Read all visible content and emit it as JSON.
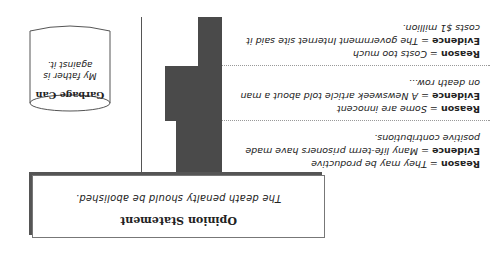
{
  "diagram": {
    "orientation": "rotated-180",
    "opinion": {
      "title": "Opinion Statement",
      "text": "The death penalty should be abolished."
    },
    "reasons": [
      {
        "reason_label": "Reason",
        "reason_text": "They may be productive",
        "evidence_label": "Evidence",
        "evidence_text": "Many life-term prisoners have made positive contributions."
      },
      {
        "reason_label": "Reason",
        "reason_text": "Some are innocent",
        "evidence_label": "Evidence",
        "evidence_text": "A Newsweek article told about a man on death row..."
      },
      {
        "reason_label": "Reason",
        "reason_text": "Costs too much",
        "evidence_label": "Evidence",
        "evidence_text": "The government Internet site said it costs $1 million."
      }
    ],
    "garbage_can": {
      "title": "Garbage Can",
      "text": "My father is against it."
    },
    "colors": {
      "bar": "#4a4a4a",
      "border": "#555555",
      "text": "#222222"
    }
  }
}
